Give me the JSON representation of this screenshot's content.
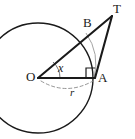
{
  "figure": {
    "kind": "circle-tangent-geometry-diagram",
    "background_color": "#ffffff",
    "stroke_color": "#1a1a1a",
    "thin_stroke_color": "#808080",
    "dashed_stroke_color": "#999999"
  },
  "labels": {
    "center": "O",
    "tangent_point": "A",
    "external_point": "T",
    "arc_point": "B",
    "angle": "x",
    "radius": "r"
  },
  "geometry": {
    "circle": {
      "cx": 38,
      "cy": 78,
      "r": 55
    },
    "points": {
      "O": {
        "x": 38,
        "y": 78
      },
      "A": {
        "x": 94,
        "y": 78
      },
      "T": {
        "x": 112,
        "y": 16
      },
      "B": {
        "x": 86,
        "y": 33
      }
    },
    "segments": [
      {
        "name": "OT",
        "from": "O",
        "to": "T",
        "style": "thick"
      },
      {
        "name": "OA",
        "from": "O",
        "to": "A",
        "style": "thick"
      },
      {
        "name": "AT",
        "from": "A",
        "to": "T",
        "style": "thick"
      }
    ],
    "arcs": [
      {
        "name": "circle-outline",
        "style": "solid"
      },
      {
        "name": "BA-minor-arc",
        "style": "thin-gray"
      },
      {
        "name": "radius-indicator-arc",
        "style": "dashed"
      },
      {
        "name": "angle-arc-at-O",
        "style": "thin"
      }
    ],
    "markers": [
      {
        "name": "right-angle-at-A",
        "at": "A"
      }
    ]
  }
}
